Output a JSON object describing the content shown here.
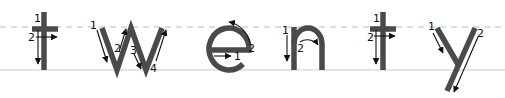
{
  "word": "twenty",
  "guides": {
    "midline_color": "#bbbbbb",
    "baseline_color": "#cccccc",
    "stroke_color": "#4a4a4a",
    "arrow_color": "#111111"
  },
  "letters": [
    {
      "char": "t",
      "strokes": [
        {
          "num": "1",
          "direction": "down"
        },
        {
          "num": "2",
          "direction": "right"
        }
      ]
    },
    {
      "char": "w",
      "strokes": [
        {
          "num": "1",
          "direction": "down-right"
        },
        {
          "num": "2",
          "direction": "up-right"
        },
        {
          "num": "3",
          "direction": "down-right"
        },
        {
          "num": "4",
          "direction": "up-right"
        }
      ]
    },
    {
      "char": "e",
      "strokes": [
        {
          "num": "1",
          "direction": "right"
        },
        {
          "num": "2",
          "direction": "counter-clockwise"
        }
      ]
    },
    {
      "char": "n",
      "strokes": [
        {
          "num": "1",
          "direction": "down"
        },
        {
          "num": "2",
          "direction": "clockwise-arch"
        }
      ]
    },
    {
      "char": "t",
      "strokes": [
        {
          "num": "1",
          "direction": "down"
        },
        {
          "num": "2",
          "direction": "right"
        }
      ]
    },
    {
      "char": "y",
      "strokes": [
        {
          "num": "1",
          "direction": "down-right"
        },
        {
          "num": "2",
          "direction": "down-left"
        }
      ]
    }
  ]
}
